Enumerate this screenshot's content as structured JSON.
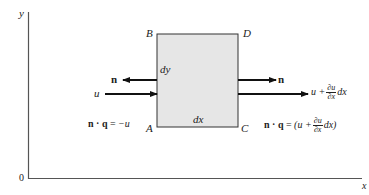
{
  "diagram": {
    "axes": {
      "y_label": "y",
      "x_label": "x",
      "origin_label": "0"
    },
    "element": {
      "corners": {
        "top_left": "B",
        "top_right": "D",
        "bottom_left": "A",
        "bottom_right": "C"
      },
      "height_label": "dy",
      "width_label": "dx",
      "fill_color": "#e6e6e6"
    },
    "left_face": {
      "normal_label": "n",
      "flux_label": "u",
      "equation": {
        "lhs": "n · q",
        "eq": "=",
        "rhs": "−u"
      }
    },
    "right_face": {
      "normal_label": "n",
      "flux_label": {
        "base": "u +",
        "frac_num": "∂u",
        "frac_den": "∂x",
        "tail": "dx"
      },
      "equation": {
        "lhs": "n · q",
        "eq": "=",
        "open": "(u +",
        "frac_num": "∂u",
        "frac_den": "∂x",
        "tail": "dx)"
      }
    }
  }
}
